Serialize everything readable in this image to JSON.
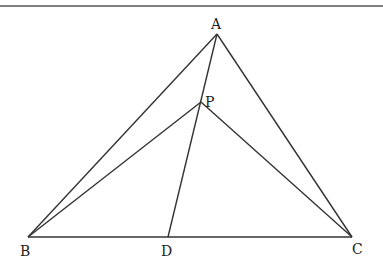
{
  "diagram": {
    "type": "geometry",
    "points": {
      "A": {
        "x": 217,
        "y": 34,
        "label": "A",
        "label_x": 211,
        "label_y": 29
      },
      "B": {
        "x": 28,
        "y": 237,
        "label": "B",
        "label_x": 20,
        "label_y": 256
      },
      "C": {
        "x": 352,
        "y": 237,
        "label": "C",
        "label_x": 352,
        "label_y": 254
      },
      "D": {
        "x": 168,
        "y": 237,
        "label": "D",
        "label_x": 161,
        "label_y": 256
      },
      "P": {
        "x": 201,
        "y": 102,
        "label": "P",
        "label_x": 205,
        "label_y": 107
      }
    },
    "segments": [
      {
        "from": "A",
        "to": "B"
      },
      {
        "from": "A",
        "to": "C"
      },
      {
        "from": "B",
        "to": "C"
      },
      {
        "from": "A",
        "to": "D"
      },
      {
        "from": "P",
        "to": "B"
      },
      {
        "from": "P",
        "to": "C"
      }
    ],
    "top_rule": {
      "y": 6,
      "x1": 0,
      "x2": 383
    },
    "colors": {
      "line": "#333333",
      "text": "#222222",
      "background": "#ffffff"
    }
  }
}
